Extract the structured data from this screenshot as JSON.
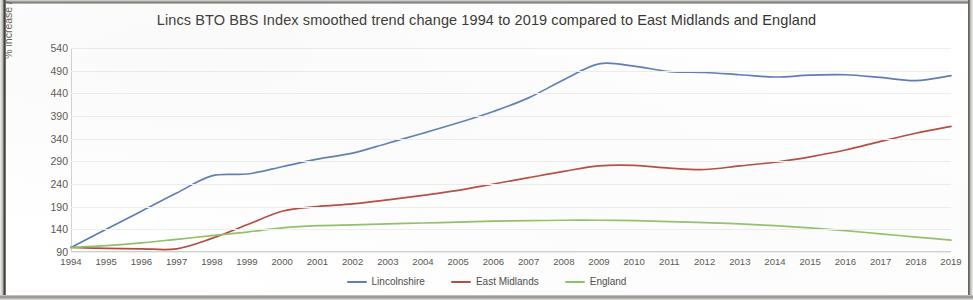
{
  "chart_data": {
    "type": "line",
    "title": "Lincs BTO BBS Index smoothed trend change 1994 to 2019 compared to East Midlands and England",
    "xlabel": "",
    "ylabel": "% increase / decrease since 1994",
    "categories": [
      "1994",
      "1995",
      "1996",
      "1997",
      "1998",
      "1999",
      "2000",
      "2001",
      "2002",
      "2003",
      "2004",
      "2005",
      "2006",
      "2007",
      "2008",
      "2009",
      "2010",
      "2011",
      "2012",
      "2013",
      "2014",
      "2015",
      "2016",
      "2017",
      "2018",
      "2019"
    ],
    "ylim": [
      90,
      540
    ],
    "yticks": [
      90,
      140,
      190,
      240,
      290,
      340,
      390,
      440,
      490,
      540
    ],
    "grid": true,
    "legend_position": "bottom-center",
    "series": [
      {
        "name": "Lincolnshire",
        "color": "#5d7cb4",
        "values": [
          100,
          140,
          180,
          220,
          258,
          262,
          278,
          295,
          308,
          330,
          352,
          375,
          400,
          430,
          470,
          505,
          500,
          488,
          486,
          481,
          476,
          480,
          481,
          475,
          468,
          479
        ]
      },
      {
        "name": "East Midlands",
        "color": "#b4493f",
        "values": [
          100,
          98,
          97,
          97,
          120,
          150,
          180,
          190,
          196,
          205,
          215,
          226,
          240,
          254,
          268,
          280,
          281,
          275,
          272,
          280,
          288,
          300,
          315,
          334,
          352,
          367
        ]
      },
      {
        "name": "England",
        "color": "#8fc068",
        "values": [
          100,
          104,
          110,
          118,
          126,
          134,
          143,
          148,
          150,
          152,
          154,
          156,
          158,
          159,
          160,
          160,
          159,
          157,
          155,
          152,
          148,
          143,
          137,
          130,
          123,
          116
        ]
      }
    ]
  },
  "legend": {
    "items": [
      {
        "label": "Lincolnshire",
        "color": "#5d7cb4"
      },
      {
        "label": "East Midlands",
        "color": "#b4493f"
      },
      {
        "label": "England",
        "color": "#8fc068"
      }
    ]
  }
}
